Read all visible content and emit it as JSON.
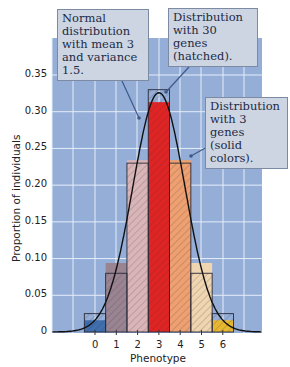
{
  "chart_data": {
    "type": "bar",
    "title": "",
    "xlabel": "Phenotype",
    "ylabel": "Proportion of individuals",
    "categories": [
      "0",
      "1",
      "2",
      "3",
      "4",
      "5",
      "6"
    ],
    "ylim": [
      0,
      0.37
    ],
    "yticks": [
      0,
      0.05,
      0.1,
      0.15,
      0.2,
      0.25,
      0.3,
      0.35
    ],
    "ytick_labels": [
      "0",
      "0.05",
      "0.10",
      "0.15",
      "0.20",
      "0.25",
      "0.30",
      "0.35"
    ],
    "grid": true,
    "series": [
      {
        "name": "Distribution with 3 genes (solid colors)",
        "style": "solid",
        "values": [
          0.016,
          0.094,
          0.234,
          0.313,
          0.234,
          0.094,
          0.016
        ],
        "colors": [
          "#3f6fae",
          "#9a8492",
          "#d9b5b8",
          "#e02424",
          "#eea070",
          "#efd5b0",
          "#e8b830"
        ]
      },
      {
        "name": "Distribution with 30 genes (hatched)",
        "style": "hatched-outline",
        "values": [
          0.025,
          0.08,
          0.23,
          0.33,
          0.23,
          0.08,
          0.025
        ]
      },
      {
        "name": "Normal distribution with mean 3 and variance 1.5",
        "style": "line",
        "mean": 3,
        "variance": 1.5
      }
    ],
    "annotations": [
      "Normal distribution with mean 3 and variance 1.5.",
      "Distribution with 30 genes (hatched).",
      "Distribution with 3 genes (solid colors)."
    ]
  },
  "callouts": {
    "normal": [
      "Normal",
      "distribution",
      "with mean 3",
      "and variance 1.5."
    ],
    "genes30": [
      "Distribution",
      "with 30 genes",
      "(hatched)."
    ],
    "genes3": [
      "Distribution",
      "with 3 genes",
      "(solid colors)."
    ]
  },
  "colors": {
    "plot_bg": "#94aed8",
    "grid": "#e6edf8",
    "curve": "#111111",
    "callout_bg": "#cdd5e3",
    "leader": "#3d5a8a"
  }
}
